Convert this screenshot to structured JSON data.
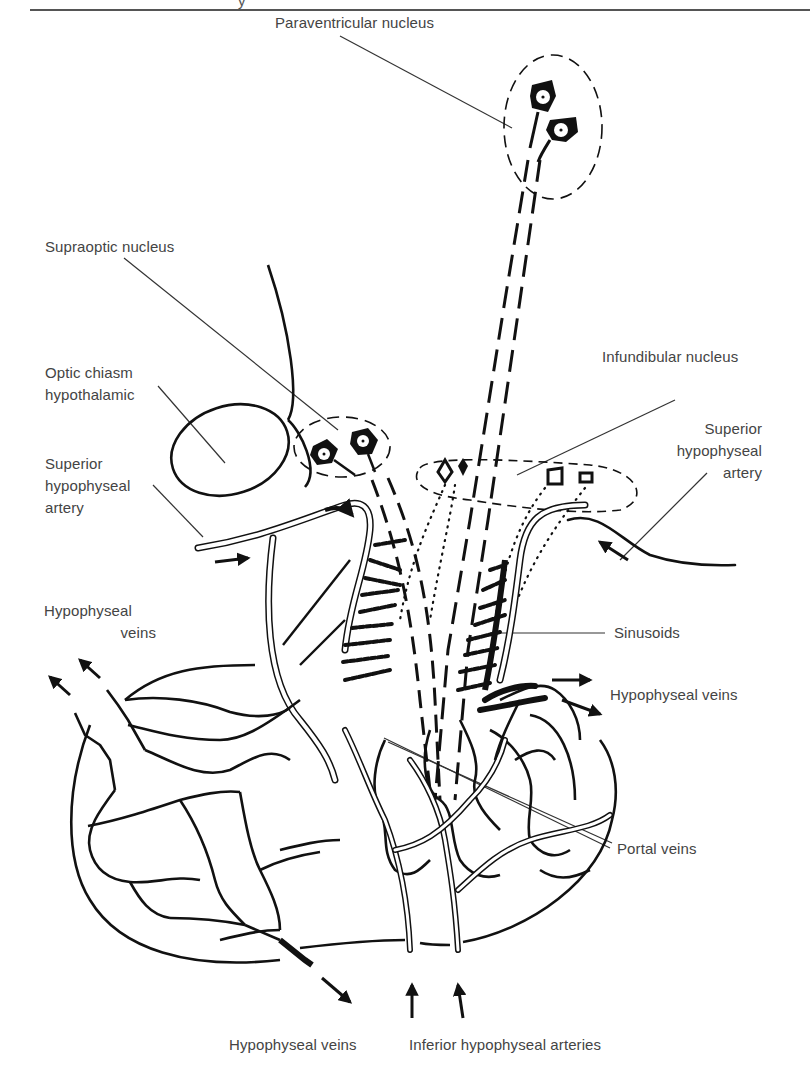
{
  "header": {
    "fragment": "y"
  },
  "labels": {
    "paraventricular": "Paraventricular nucleus",
    "supraoptic": "Supraoptic nucleus",
    "optic_chiasm": [
      "Optic chiasm",
      "hypothalamic"
    ],
    "superior_left": [
      "Superior",
      "hypophyseal",
      "artery"
    ],
    "infundibular": "Infundibular nucleus",
    "superior_right": [
      "Superior",
      "hypophyseal",
      "artery"
    ],
    "hypophyseal_veins_left": [
      "Hypophyseal",
      "veins"
    ],
    "sinusoids": "Sinusoids",
    "hypophyseal_veins_right": "Hypophyseal veins",
    "portal_veins": "Portal veins",
    "hypophyseal_veins_bottom": "Hypophyseal veins",
    "inferior_arteries": "Inferior hypophyseal arteries"
  },
  "colors": {
    "ink": "#111111",
    "label_text": "#444444",
    "leader_line": "#333333",
    "background": "#ffffff"
  }
}
